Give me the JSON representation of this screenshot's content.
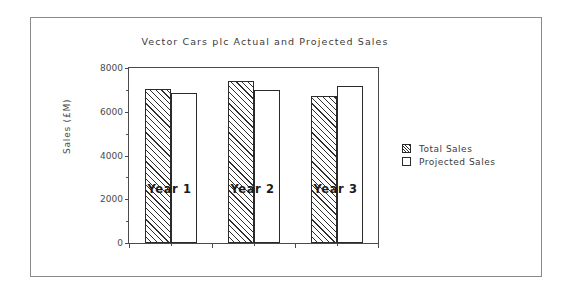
{
  "chart_data": {
    "type": "bar",
    "title": "Vector Cars plc Actual and Projected Sales",
    "xlabel": "",
    "ylabel": "Sales  (£M)",
    "categories": [
      "Year 1",
      "Year 2",
      "Year 3"
    ],
    "series": [
      {
        "name": "Total Sales",
        "values": [
          7060,
          7400,
          6740
        ],
        "fill": "hatched"
      },
      {
        "name": "Projected Sales",
        "values": [
          6870,
          7000,
          7180
        ],
        "fill": "empty"
      }
    ],
    "ylim": [
      0,
      8000
    ],
    "ytick_labels": [
      "0",
      "2000",
      "4000",
      "6000",
      "8000"
    ],
    "ytick_values": [
      0,
      2000,
      4000,
      6000,
      8000
    ],
    "yminor_values": [
      1000,
      3000,
      5000,
      7000
    ],
    "grid": false,
    "legend_position": "right",
    "colors": {
      "axis": "#4a4a4a",
      "bar_edge": "#2a2a2a",
      "hatch": "#2f2f2f",
      "frame": "#8a8a8a",
      "background": "#ffffff",
      "title_text": "#3b3b3b",
      "xlabel_text": "#1a1a1a"
    }
  },
  "legend": {
    "items": [
      {
        "label": "Total Sales"
      },
      {
        "label": "Projected Sales"
      }
    ]
  }
}
